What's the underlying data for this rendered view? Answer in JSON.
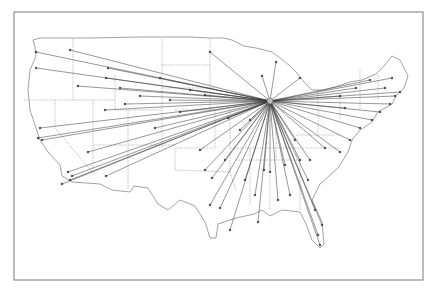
{
  "map": {
    "type": "route-map",
    "region": "Contiguous United States",
    "frame": {
      "x": 14,
      "y": 12,
      "w": 409,
      "h": 268,
      "stroke": "#7a7a7a"
    },
    "colors": {
      "background": "#ffffff",
      "outline": "#8a8a8a",
      "borders": "#9a9a9a",
      "routes": "#3a3a3a"
    },
    "hub": {
      "x": 270,
      "y": 101
    },
    "destinations": [
      [
        36,
        52
      ],
      [
        70,
        50
      ],
      [
        108,
        68
      ],
      [
        210,
        52
      ],
      [
        36,
        68
      ],
      [
        78,
        86
      ],
      [
        105,
        110
      ],
      [
        120,
        88
      ],
      [
        160,
        78
      ],
      [
        190,
        90
      ],
      [
        40,
        128
      ],
      [
        38,
        138
      ],
      [
        42,
        140
      ],
      [
        88,
        152
      ],
      [
        70,
        180
      ],
      [
        72,
        176
      ],
      [
        68,
        172
      ],
      [
        106,
        176
      ],
      [
        155,
        128
      ],
      [
        205,
        95
      ],
      [
        106,
        78
      ],
      [
        62,
        184
      ],
      [
        200,
        150
      ],
      [
        225,
        160
      ],
      [
        205,
        170
      ],
      [
        212,
        178
      ],
      [
        210,
        205
      ],
      [
        220,
        208
      ],
      [
        230,
        230
      ],
      [
        245,
        180
      ],
      [
        258,
        222
      ],
      [
        264,
        170
      ],
      [
        255,
        195
      ],
      [
        270,
        172
      ],
      [
        278,
        200
      ],
      [
        285,
        165
      ],
      [
        290,
        195
      ],
      [
        295,
        140
      ],
      [
        300,
        160
      ],
      [
        310,
        160
      ],
      [
        318,
        235
      ],
      [
        320,
        245
      ],
      [
        322,
        225
      ],
      [
        315,
        210
      ],
      [
        308,
        180
      ],
      [
        325,
        148
      ],
      [
        340,
        152
      ],
      [
        350,
        140
      ],
      [
        360,
        128
      ],
      [
        372,
        120
      ],
      [
        380,
        112
      ],
      [
        390,
        104
      ],
      [
        395,
        96
      ],
      [
        385,
        88
      ],
      [
        370,
        80
      ],
      [
        392,
        78
      ],
      [
        400,
        92
      ],
      [
        356,
        88
      ],
      [
        340,
        96
      ],
      [
        345,
        108
      ],
      [
        300,
        78
      ],
      [
        262,
        76
      ],
      [
        276,
        62
      ],
      [
        250,
        120
      ],
      [
        240,
        130
      ],
      [
        228,
        118
      ],
      [
        180,
        112
      ],
      [
        170,
        100
      ],
      [
        140,
        96
      ],
      [
        125,
        104
      ]
    ]
  }
}
